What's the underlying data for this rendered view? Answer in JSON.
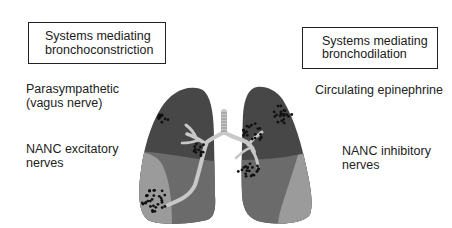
{
  "left_panel": {
    "header_lines": [
      "Systems mediating",
      "bronchoconstriction"
    ],
    "items": [
      {
        "lines": [
          "Parasympathetic",
          "(vagus nerve)"
        ]
      },
      {
        "lines": [
          "NANC excitatory",
          "nerves"
        ]
      }
    ]
  },
  "right_panel": {
    "header_lines": [
      "Systems mediating",
      "bronchodilation"
    ],
    "items": [
      {
        "lines": [
          "Circulating epinephrine"
        ]
      },
      {
        "lines": [
          "NANC inhibitory",
          "nerves"
        ]
      }
    ]
  },
  "illustration": {
    "subject": "lungs-with-bronchial-tree",
    "colors": {
      "upper_lobe": "#474747",
      "middle_lobe": "#6b6b6b",
      "lower_lobe": "#9b9b9b",
      "airway": "#c8c8c8",
      "receptor_dots": "#111111"
    }
  }
}
